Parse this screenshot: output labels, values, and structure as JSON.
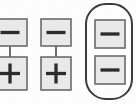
{
  "figure": {
    "title": "",
    "type": "node-link-diagram",
    "background_color": "#fdfdfd",
    "stroke_color": "#4a4a4a",
    "node_fill_color": "#e9e9e9",
    "node_border_color": "#6b6b6b",
    "sign_color": "#2b2b2b",
    "group_outline_color": "#3c3c3c",
    "groups": [
      {
        "id": "group-left",
        "label": "left-pair",
        "clipped_at_left_edge": true,
        "enclosed": false,
        "nodes": [
          {
            "id": "left-top",
            "sign": "minus",
            "symbol": "−",
            "x": -7,
            "y": 19,
            "width": 34,
            "height": 27
          },
          {
            "id": "left-bottom",
            "sign": "plus",
            "symbol": "+",
            "x": -7,
            "y": 57,
            "width": 34,
            "height": 33
          }
        ],
        "links": [
          {
            "from": "left-top",
            "to": "left-bottom",
            "x": 10,
            "y1": 46,
            "y2": 57
          }
        ]
      },
      {
        "id": "group-middle",
        "label": "middle-pair",
        "clipped_at_left_edge": false,
        "enclosed": false,
        "nodes": [
          {
            "id": "middle-top",
            "sign": "minus",
            "symbol": "−",
            "x": 41,
            "y": 19,
            "width": 30,
            "height": 27
          },
          {
            "id": "middle-bottom",
            "sign": "plus",
            "symbol": "+",
            "x": 41,
            "y": 57,
            "width": 30,
            "height": 33
          }
        ],
        "links": [
          {
            "from": "middle-top",
            "to": "middle-bottom",
            "x": 56,
            "y1": 46,
            "y2": 57
          }
        ]
      },
      {
        "id": "group-right",
        "label": "enclosed-pair",
        "clipped_at_left_edge": false,
        "enclosed": true,
        "enclosure": {
          "x": 86,
          "y": 4,
          "width": 46,
          "height": 95,
          "corner_radius": 20
        },
        "nodes": [
          {
            "id": "right-top",
            "sign": "minus",
            "symbol": "−",
            "x": 95,
            "y": 20,
            "width": 30,
            "height": 28
          },
          {
            "id": "right-bottom",
            "sign": "minus",
            "symbol": "−",
            "x": 95,
            "y": 56,
            "width": 30,
            "height": 28
          }
        ],
        "links": []
      }
    ],
    "counts": {
      "total_nodes": 6,
      "minus_nodes": 4,
      "plus_nodes": 2,
      "groups": 3,
      "links": 2
    }
  }
}
